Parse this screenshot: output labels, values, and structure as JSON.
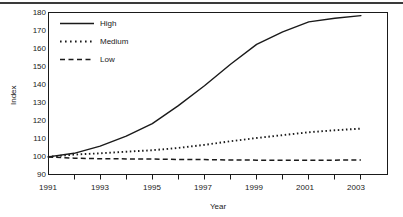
{
  "chart_data": {
    "type": "line",
    "title": "",
    "xlabel": "Year",
    "ylabel": "Index",
    "xlim": [
      1991,
      2004
    ],
    "ylim": [
      90,
      180
    ],
    "grid": false,
    "legend_position": "top-left",
    "x_tick_labels": [
      "1991",
      "1993",
      "1995",
      "1997",
      "1999",
      "2001",
      "2003"
    ],
    "x_tick_values": [
      1991,
      1993,
      1995,
      1997,
      1999,
      2001,
      2003
    ],
    "x_minor_ticks": [
      1992,
      1994,
      1996,
      1998,
      2000,
      2002,
      2004
    ],
    "y_tick_labels": [
      "90",
      "100",
      "110",
      "120",
      "130",
      "140",
      "150",
      "160",
      "170",
      "180"
    ],
    "y_tick_values": [
      90,
      100,
      110,
      120,
      130,
      140,
      150,
      160,
      170,
      180
    ],
    "x": [
      1991,
      1992,
      1993,
      1994,
      1995,
      1996,
      1997,
      1998,
      1999,
      2000,
      2001,
      2002,
      2003
    ],
    "series": [
      {
        "name": "High",
        "style": "solid",
        "color": "#1a1a1a",
        "values": [
          99.5,
          101.5,
          105.5,
          111.0,
          118.0,
          128.0,
          139.0,
          151.0,
          162.0,
          169.0,
          174.5,
          176.5,
          178.0
        ]
      },
      {
        "name": "Medium",
        "style": "dotted",
        "color": "#1a1a1a",
        "values": [
          99.5,
          100.8,
          101.5,
          102.4,
          103.2,
          104.5,
          106.2,
          108.2,
          110.0,
          111.6,
          113.2,
          114.3,
          115.2
        ]
      },
      {
        "name": "Low",
        "style": "dashed",
        "color": "#1a1a1a",
        "values": [
          99.5,
          98.8,
          98.5,
          98.4,
          98.3,
          98.1,
          98.0,
          97.8,
          97.7,
          97.7,
          97.7,
          97.7,
          97.8
        ]
      }
    ]
  },
  "legend": {
    "entries": [
      {
        "label": "High"
      },
      {
        "label": "Medium"
      },
      {
        "label": "Low"
      }
    ]
  }
}
